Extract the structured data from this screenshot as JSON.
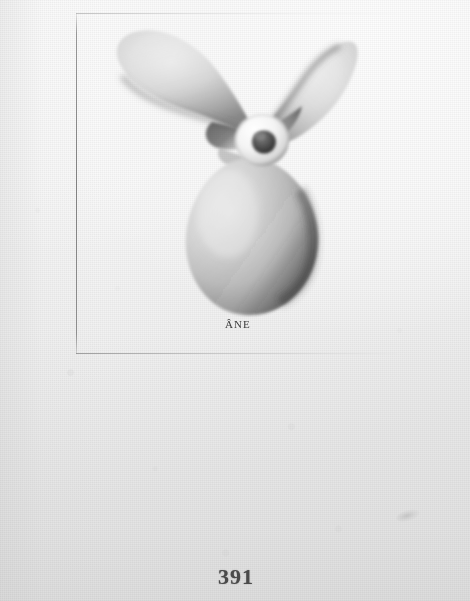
{
  "document": {
    "type": "scanned-book-page",
    "page_number": "391",
    "background_color": "#f0f0f0"
  },
  "plate": {
    "caption": "ÂNE",
    "figure_name": "three-bladed-marine-propeller",
    "border": {
      "vertical_rule": true,
      "horizontal_rule_top": true,
      "horizontal_rule_bottom": true,
      "color": "#8c8c8c"
    }
  },
  "illustration": {
    "subject": "marine screw propeller",
    "blade_count": 3,
    "blades": [
      {
        "name": "upper-left-blade",
        "tone": "light-gray"
      },
      {
        "name": "upper-right-blade",
        "tone": "light-gray"
      },
      {
        "name": "lower-blade",
        "tone": "mid-gray-shaded-right"
      }
    ],
    "hub": {
      "name": "propeller-hub",
      "tone": "white-ring-dark-bore"
    },
    "ink_color": "#5a5a5a"
  },
  "artifacts": {
    "smudge": "faint-scanner-smudge"
  }
}
